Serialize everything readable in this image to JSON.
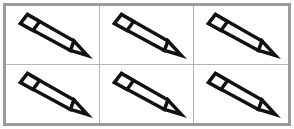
{
  "figure": {
    "kind": "crayon-grid",
    "rows": 2,
    "columns": 3,
    "total_items": 6,
    "colors": {
      "background": "#ffffff",
      "outer_frame": "#9a9a9a",
      "grid_line": "#b5b5b5",
      "crayon_outline": "#111111",
      "crayon_fill": "#ffffff"
    }
  },
  "cells": [
    {
      "id": "cell-r1c1",
      "row": 1,
      "column": 1,
      "item": "crayon",
      "orientation": "tip-down-right"
    },
    {
      "id": "cell-r1c2",
      "row": 1,
      "column": 2,
      "item": "crayon",
      "orientation": "tip-down-right"
    },
    {
      "id": "cell-r1c3",
      "row": 1,
      "column": 3,
      "item": "crayon",
      "orientation": "tip-down-right"
    },
    {
      "id": "cell-r2c1",
      "row": 2,
      "column": 1,
      "item": "crayon",
      "orientation": "tip-down-right"
    },
    {
      "id": "cell-r2c2",
      "row": 2,
      "column": 2,
      "item": "crayon",
      "orientation": "tip-down-right"
    },
    {
      "id": "cell-r2c3",
      "row": 2,
      "column": 3,
      "item": "crayon",
      "orientation": "tip-down-right"
    }
  ]
}
